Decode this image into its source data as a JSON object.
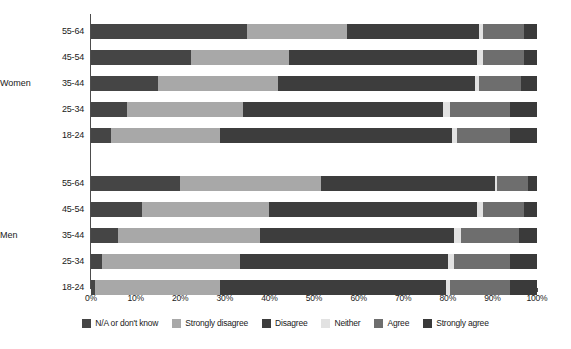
{
  "chart_data": {
    "type": "bar",
    "subtype": "stacked-horizontal-100pct",
    "title": "",
    "xlabel": "",
    "ylabel": "",
    "xlim": [
      0,
      100
    ],
    "xticks": [
      "0%",
      "10%",
      "20%",
      "30%",
      "40%",
      "50%",
      "60%",
      "70%",
      "80%",
      "90%",
      "100%"
    ],
    "xtick_values": [
      0,
      10,
      20,
      30,
      40,
      50,
      60,
      70,
      80,
      90,
      100
    ],
    "grid": false,
    "legend_position": "bottom",
    "orientation": "horizontal",
    "series": [
      {
        "name": "N/A or don't know",
        "color": "#454545"
      },
      {
        "name": "Strongly disagree",
        "color": "#a8a8a8"
      },
      {
        "name": "Disagree",
        "color": "#3d3d3d"
      },
      {
        "name": "Neither",
        "color": "#e2e2e2"
      },
      {
        "name": "Agree",
        "color": "#6e6e6e"
      },
      {
        "name": "Strongly agree",
        "color": "#3a3a3a"
      }
    ],
    "groups": [
      {
        "name": "Women",
        "categories": [
          "55-64",
          "45-54",
          "35-44",
          "25-34",
          "18-24"
        ],
        "rows": [
          {
            "category": "55-64",
            "values": [
              35.0,
              22.5,
              29.5,
              1.0,
              9.0,
              3.0
            ]
          },
          {
            "category": "45-54",
            "values": [
              22.5,
              22.0,
              42.0,
              1.5,
              9.0,
              3.0
            ]
          },
          {
            "category": "35-44",
            "values": [
              15.0,
              27.0,
              44.0,
              1.0,
              9.5,
              3.5
            ]
          },
          {
            "category": "25-34",
            "values": [
              8.0,
              26.0,
              45.0,
              1.5,
              13.5,
              6.0
            ]
          },
          {
            "category": "18-24",
            "values": [
              4.5,
              24.5,
              52.0,
              1.0,
              12.0,
              6.0
            ]
          }
        ]
      },
      {
        "name": "Men",
        "categories": [
          "55-64",
          "45-54",
          "35-44",
          "25-34",
          "18-24"
        ],
        "rows": [
          {
            "category": "55-64",
            "values": [
              20.0,
              31.5,
              39.0,
              0.5,
              7.0,
              2.0
            ]
          },
          {
            "category": "45-54",
            "values": [
              11.5,
              28.5,
              46.5,
              1.5,
              9.0,
              3.0
            ]
          },
          {
            "category": "35-44",
            "values": [
              6.0,
              32.0,
              43.5,
              1.5,
              13.0,
              4.0
            ]
          },
          {
            "category": "25-34",
            "values": [
              2.5,
              31.0,
              46.5,
              1.5,
              12.5,
              6.0
            ]
          },
          {
            "category": "18-24",
            "values": [
              1.0,
              28.0,
              50.5,
              1.0,
              13.5,
              6.0
            ]
          }
        ]
      }
    ]
  },
  "axis": {
    "x_tick_labels": [
      "0%",
      "10%",
      "20%",
      "30%",
      "40%",
      "50%",
      "60%",
      "70%",
      "80%",
      "90%",
      "100%"
    ]
  },
  "legend": {
    "items": [
      {
        "label": "N/A or don't know",
        "color": "#454545",
        "swatch_name": "legend-swatch-na"
      },
      {
        "label": "Strongly disagree",
        "color": "#a8a8a8",
        "swatch_name": "legend-swatch-strongly-disagree"
      },
      {
        "label": "Disagree",
        "color": "#3d3d3d",
        "swatch_name": "legend-swatch-disagree"
      },
      {
        "label": "Neither",
        "color": "#e2e2e2",
        "swatch_name": "legend-swatch-neither"
      },
      {
        "label": "Agree",
        "color": "#6e6e6e",
        "swatch_name": "legend-swatch-agree"
      },
      {
        "label": "Strongly agree",
        "color": "#3a3a3a",
        "swatch_name": "legend-swatch-strongly-agree"
      }
    ]
  },
  "group_labels": [
    "Women",
    "Men"
  ],
  "category_labels": [
    "55-64",
    "45-54",
    "35-44",
    "25-34",
    "18-24"
  ]
}
